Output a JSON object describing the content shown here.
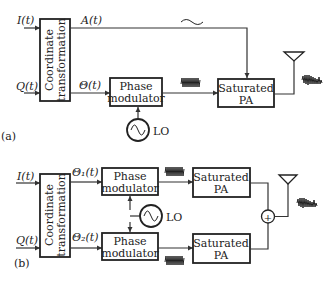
{
  "diagram": {
    "a": {
      "panel_label": "(a)",
      "inputs": {
        "i": "I(t)",
        "q": "Q(t)"
      },
      "coord_block": {
        "line1": "Coordinate",
        "line2": "transformation"
      },
      "outputs": {
        "amplitude": "A(t)",
        "phase": "Θ(t)"
      },
      "phase_modulator": {
        "line1": "Phase",
        "line2": "modulator"
      },
      "lo_label": "LO",
      "pa": {
        "line1": "Saturated",
        "line2": "PA"
      },
      "amplitude_signal_icon": "tilde-waveform-icon",
      "pm_signal_icon": "constant-envelope-waveform-icon",
      "output_signal_icon": "modulated-waveform-icon",
      "antenna_icon": "antenna-icon"
    },
    "b": {
      "panel_label": "(b)",
      "inputs": {
        "i": "I(t)",
        "q": "Q(t)"
      },
      "coord_block": {
        "line1": "Coordinate",
        "line2": "transformation"
      },
      "outputs": {
        "theta1": "Θ₁(t)",
        "theta2": "Θ₂(t)"
      },
      "phase_modulator_top": {
        "line1": "Phase",
        "line2": "modulator"
      },
      "phase_modulator_bottom": {
        "line1": "Phase",
        "line2": "modulator"
      },
      "lo_label": "LO",
      "pa_top": {
        "line1": "Saturated",
        "line2": "PA"
      },
      "pa_bottom": {
        "line1": "Saturated",
        "line2": "PA"
      },
      "combiner_symbol": "+",
      "antenna_icon": "antenna-icon"
    }
  }
}
